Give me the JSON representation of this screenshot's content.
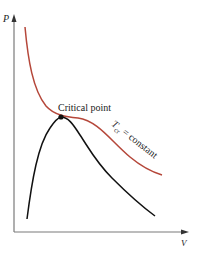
{
  "diagram": {
    "type": "P-V diagram",
    "axes": {
      "y_label": "P",
      "x_label": "V"
    },
    "labels": {
      "critical_point": "Critical point",
      "isotherm_T": "T",
      "isotherm_sub": "cr",
      "isotherm_rest": " = constant"
    },
    "colors": {
      "isotherm": "#b5473a",
      "dome": "#111111",
      "axes": "#7a7a7a",
      "point": "#111111"
    },
    "elements": [
      {
        "name": "critical-isotherm",
        "description": "Critical isotherm curve T_cr = constant"
      },
      {
        "name": "saturation-dome",
        "description": "Saturated liquid/vapor dome"
      },
      {
        "name": "critical-point",
        "description": "Critical point at top of dome"
      }
    ]
  }
}
